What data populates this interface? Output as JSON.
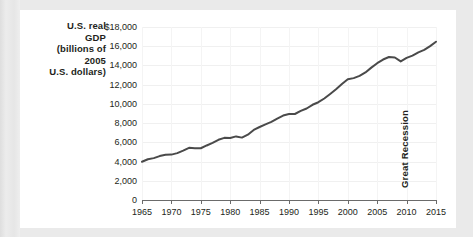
{
  "chart_data": {
    "type": "line",
    "title": "",
    "ylabel_lines": [
      "U.S. real",
      "GDP",
      "(billions of",
      "2005",
      "U.S. dollars)"
    ],
    "xlabel": "",
    "xlim": [
      1965,
      2015
    ],
    "ylim": [
      0,
      18000
    ],
    "grid": true,
    "legend": "none",
    "y_ticks": [
      0,
      2000,
      4000,
      6000,
      8000,
      10000,
      12000,
      14000,
      16000,
      18000
    ],
    "y_tick_labels": [
      "0",
      "2,000",
      "4,000",
      "6,000",
      "8,000",
      "10,000",
      "12,000",
      "14,000",
      "16,000",
      "$18,000"
    ],
    "x_ticks": [
      1965,
      1970,
      1975,
      1980,
      1985,
      1990,
      1995,
      2000,
      2005,
      2010,
      2015
    ],
    "x_tick_labels": [
      "1965",
      "1970",
      "1975",
      "1980",
      "1985",
      "1990",
      "1995",
      "2000",
      "2005",
      "2010",
      "2015"
    ],
    "line_color": "#4a4a4a",
    "grid_color": "#f0f0f0",
    "axis_color": "#6b6b6b",
    "annotations": [
      {
        "text": "Great Recession",
        "x": 2008,
        "rotation": -90
      }
    ],
    "series": [
      {
        "name": "U.S. real GDP",
        "x": [
          1965,
          1966,
          1967,
          1968,
          1969,
          1970,
          1971,
          1972,
          1973,
          1974,
          1975,
          1976,
          1977,
          1978,
          1979,
          1980,
          1981,
          1982,
          1983,
          1984,
          1985,
          1986,
          1987,
          1988,
          1989,
          1990,
          1991,
          1992,
          1993,
          1994,
          1995,
          1996,
          1997,
          1998,
          1999,
          2000,
          2001,
          2002,
          2003,
          2004,
          2005,
          2006,
          2007,
          2008,
          2009,
          2010,
          2011,
          2012,
          2013,
          2014,
          2015
        ],
        "values": [
          3976,
          4239,
          4356,
          4569,
          4713,
          4722,
          4878,
          5135,
          5430,
          5397,
          5385,
          5675,
          5937,
          6267,
          6466,
          6450,
          6617,
          6491,
          6792,
          7285,
          7594,
          7861,
          8133,
          8475,
          8786,
          8955,
          8948,
          9267,
          9521,
          9906,
          10175,
          10561,
          11035,
          11526,
          12066,
          12560,
          12682,
          12909,
          13271,
          13774,
          14234,
          14614,
          14874,
          14830,
          14419,
          14784,
          15021,
          15355,
          15612,
          16013,
          16472
        ]
      }
    ]
  }
}
